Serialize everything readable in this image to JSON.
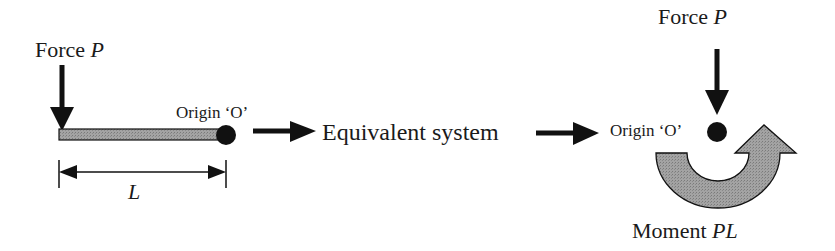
{
  "diagram": {
    "type": "mechanics-equivalent-system",
    "colors": {
      "ink": "#111111",
      "fill_gray": "#9a9a9a",
      "background": "#ffffff"
    },
    "left_system": {
      "force_label_prefix": "Force ",
      "force_label_symbol": "P",
      "origin_label": "Origin ‘O’",
      "length_label": "L"
    },
    "middle": {
      "label": "Equivalent system"
    },
    "right_system": {
      "force_label_prefix": "Force ",
      "force_label_symbol": "P",
      "origin_label": "Origin ‘O’",
      "moment_label_prefix": "Moment ",
      "moment_label_symbol": "PL"
    }
  }
}
